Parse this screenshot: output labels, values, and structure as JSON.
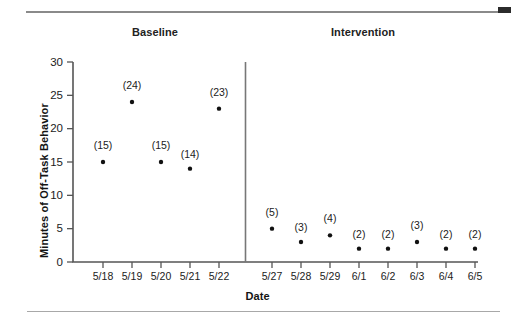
{
  "figure": {
    "top_rule_marker": "black-block-marker",
    "phase_titles": [
      "Baseline",
      "Intervention"
    ]
  },
  "chart_data": {
    "type": "scatter",
    "title": "",
    "xlabel": "Date",
    "ylabel": "Minutes of Off-Task Behavior",
    "ylim": [
      0,
      30
    ],
    "yticks": [
      0,
      5,
      10,
      15,
      20,
      25,
      30
    ],
    "ytick_labels": [
      "0",
      "5",
      "10",
      "15",
      "20",
      "25",
      "30"
    ],
    "grid": false,
    "legend": "none",
    "phases": [
      {
        "name": "Baseline",
        "categories": [
          "5/18",
          "5/19",
          "5/20",
          "5/21",
          "5/22"
        ],
        "values": [
          15,
          24,
          15,
          14,
          23
        ],
        "point_labels": [
          "(15)",
          "(24)",
          "(15)",
          "(14)",
          "(23)"
        ]
      },
      {
        "name": "Intervention",
        "categories": [
          "5/27",
          "5/28",
          "5/29",
          "6/1",
          "6/2",
          "6/3",
          "6/4",
          "6/5"
        ],
        "values": [
          5,
          3,
          4,
          2,
          2,
          3,
          2,
          2
        ],
        "point_labels": [
          "(5)",
          "(3)",
          "(4)",
          "(2)",
          "(2)",
          "(3)",
          "(2)",
          "(2)"
        ]
      }
    ],
    "categories": [
      "5/18",
      "5/19",
      "5/20",
      "5/21",
      "5/22",
      "5/27",
      "5/28",
      "5/29",
      "6/1",
      "6/2",
      "6/3",
      "6/4",
      "6/5"
    ],
    "values": [
      15,
      24,
      15,
      14,
      23,
      5,
      3,
      4,
      2,
      2,
      3,
      2,
      2
    ],
    "point_labels": [
      "(15)",
      "(24)",
      "(15)",
      "(14)",
      "(23)",
      "(5)",
      "(3)",
      "(4)",
      "(2)",
      "(2)",
      "(3)",
      "(2)",
      "(2)"
    ],
    "phase_divider_after_category": "5/22",
    "colors": {
      "point": "#111111",
      "axis": "#555555",
      "rule": "#8a8a8a",
      "marker_block": "#2b2b2b"
    }
  }
}
